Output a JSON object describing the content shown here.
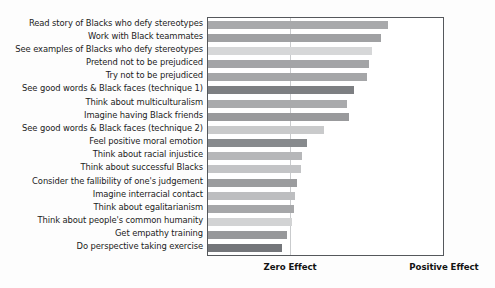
{
  "chart_data": {
    "type": "bar",
    "orientation": "horizontal",
    "title": "",
    "subtitle": "",
    "xlabel": "",
    "ylabel": "",
    "grid": false,
    "legend": null,
    "axis_captions": {
      "zero": "Zero Effect",
      "positive": "Positive Effect"
    },
    "x_axis": {
      "zero_position_fraction": 0.35,
      "tick_labels": [
        "Zero Effect",
        "Positive Effect"
      ],
      "range_description": "Effect size from negative (left edge) to positive (right edge)"
    },
    "categories": [
      "Read story of Blacks who defy stereotypes",
      "Work with Black teammates",
      "See examples of Blacks who defy stereotypes",
      "Pretend not to be prejudiced",
      "Try not to be prejudiced",
      "See good words & Black faces (technique 1)",
      "Think about multiculturalism",
      "Imagine having Black friends",
      "See good words & Black faces (technique 2)",
      "Feel positive moral emotion",
      "Think about racial injustice",
      "Think about successful Blacks",
      "Consider the fallibility of one's judgement",
      "Imagine interracial contact",
      "Think about egalitarianism",
      "Think about people's common humanity",
      "Get empathy training",
      "Do perspective taking exercise"
    ],
    "values": [
      0.767,
      0.738,
      0.696,
      0.684,
      0.675,
      0.62,
      0.591,
      0.599,
      0.494,
      0.422,
      0.401,
      0.397,
      0.38,
      0.372,
      0.367,
      0.359,
      0.338,
      0.316
    ],
    "bar_colors": [
      "#a8a9ab",
      "#a0a1a3",
      "#d6d7d8",
      "#a3a4a6",
      "#a5a6a8",
      "#7d7f82",
      "#a9aaac",
      "#999a9c",
      "#c9cacb",
      "#878a8d",
      "#b6b7b9",
      "#c3c4c6",
      "#9b9c9e",
      "#bdbec0",
      "#a6a7a9",
      "#d2d3d4",
      "#97989a",
      "#74767a"
    ]
  },
  "figure": {
    "background_color": "#fdfdfd",
    "plot_background_color": "#ffffff",
    "frame_color": "#55585c",
    "zero_line_color": "#c9cbcd"
  }
}
